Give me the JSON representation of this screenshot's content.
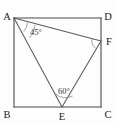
{
  "figure": {
    "background_color": "#fdfdfd",
    "line_color": "#4a4a4a",
    "cevian_color": "#5a5a5a",
    "arc_color": "#8a8a8a",
    "label_color": "#1c1c1c",
    "width": 118,
    "height": 124
  },
  "vertices": {
    "A": {
      "label": "A",
      "x": 14,
      "y": 18,
      "label_x": 7,
      "label_y": 16
    },
    "B": {
      "label": "B",
      "x": 14,
      "y": 107,
      "label_x": 7,
      "label_y": 114
    },
    "C": {
      "label": "C",
      "x": 101,
      "y": 107,
      "label_x": 104,
      "label_y": 114
    },
    "D": {
      "label": "D",
      "x": 101,
      "y": 18,
      "label_x": 104,
      "label_y": 16
    },
    "E": {
      "label": "E",
      "x": 62,
      "y": 107,
      "label_x": 62,
      "label_y": 120
    },
    "F": {
      "label": "F",
      "x": 101,
      "y": 41,
      "label_x": 105,
      "label_y": 44
    }
  },
  "square": {
    "name": "ABCD",
    "edges": [
      {
        "name": "AD",
        "from": "A",
        "to": "D"
      },
      {
        "name": "DC",
        "from": "D",
        "to": "C"
      },
      {
        "name": "CB",
        "from": "C",
        "to": "B"
      },
      {
        "name": "BA",
        "from": "B",
        "to": "A"
      }
    ]
  },
  "triangle": {
    "name": "AEF",
    "segments": [
      {
        "name": "AF",
        "from": "A",
        "to": "F"
      },
      {
        "name": "AE",
        "from": "A",
        "to": "E"
      },
      {
        "name": "FE",
        "from": "F",
        "to": "E"
      }
    ]
  },
  "angles": [
    {
      "name": "angle-at-A",
      "vertex": "A",
      "value": "45",
      "unit": "°",
      "text": "45°",
      "label_x": 30,
      "label_y": 35,
      "arc_path": "M 27.5 22.4 A 14 14 0 0 1 23.6 31.5",
      "arc_path_outer": "M 35.0 25.0 A 21.5 21.5 0 0 1 29.6 38.0"
    },
    {
      "name": "angle-at-E",
      "vertex": "E",
      "value": "60",
      "unit": "°",
      "text": "60°",
      "label_x": 66,
      "label_y": 94,
      "arc_path": "M 55.6 94.0 A 15 15 0 0 0 72.8 95.9"
    },
    {
      "name": "angle-at-F",
      "vertex": "F",
      "value": "",
      "unit": "",
      "text": "",
      "label_x": 0,
      "label_y": 0,
      "arc_path": "M 92.0 38.8 A 9.5 9.5 0 0 0 95.7 48.2"
    }
  ]
}
